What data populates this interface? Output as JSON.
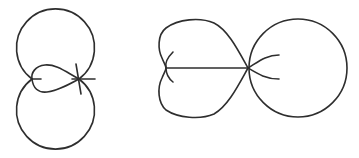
{
  "diagram": {
    "background": "#ffffff",
    "stroke_color": "#2e2e2e",
    "stroke_width": 1.6,
    "figures": [
      {
        "name": "left-figure",
        "description": "Two stacked circles with a teardrop loop between their meeting points",
        "top_circle": {
          "cx": 55,
          "cy": 42,
          "r": 38
        },
        "bottom_circle": {
          "cx": 55,
          "cy": 117,
          "r": 38
        },
        "left_node": {
          "x": 32,
          "y": 79
        },
        "right_node": {
          "x": 79,
          "y": 79
        }
      },
      {
        "name": "right-figure",
        "description": "Heart-shaped lobe joined to a circle at a crossing point with a horizontal chord",
        "circle": {
          "cx": 298,
          "cy": 68,
          "r": 49
        },
        "left_cusp": {
          "x": 166,
          "y": 68
        },
        "junction": {
          "x": 248,
          "y": 68
        }
      }
    ]
  }
}
